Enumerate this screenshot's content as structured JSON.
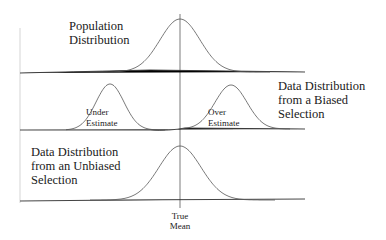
{
  "panels": [
    {
      "name": "population",
      "label_lines": [
        "Population",
        "Distribution"
      ]
    },
    {
      "name": "biased",
      "label_lines": [
        "Data Distribution",
        "from a Biased",
        "Selection"
      ],
      "annotations": [
        {
          "name": "under-estimate",
          "lines": [
            "Under",
            "Estimate"
          ]
        },
        {
          "name": "over-estimate",
          "lines": [
            "Over",
            "Estimate"
          ]
        }
      ]
    },
    {
      "name": "unbiased",
      "label_lines": [
        "Data Distribution",
        "from an Unbiased",
        "Selection"
      ]
    }
  ],
  "mean_label_lines": [
    "True",
    "Mean"
  ],
  "colors": {
    "curve": "#555555",
    "axis": "#333333",
    "text": "#1a1a1a"
  }
}
